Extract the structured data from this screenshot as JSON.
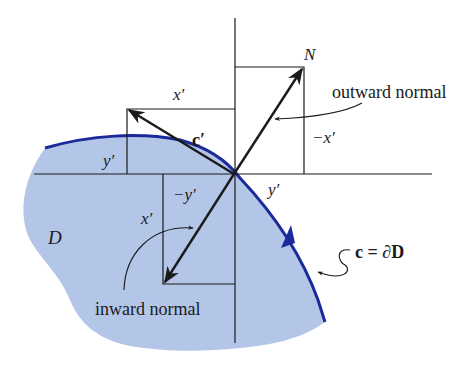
{
  "diagram": {
    "type": "vector-geometry",
    "region_label": "D",
    "boundary_label": "c = ∂D",
    "tangent_label": "c′",
    "normal_tip_label": "N",
    "outward_normal_label": "outward normal",
    "inward_normal_label": "inward normal",
    "component_labels": {
      "tangent_x": "x′",
      "tangent_y": "y′",
      "outward_neg_x": "−x′",
      "outward_y": "y′",
      "inward_neg_y": "−y′",
      "inward_x": "x′"
    },
    "colors": {
      "region_fill": "#b4c6e8",
      "boundary": "#1a2a9a",
      "lines": "#1a1a1a"
    }
  }
}
